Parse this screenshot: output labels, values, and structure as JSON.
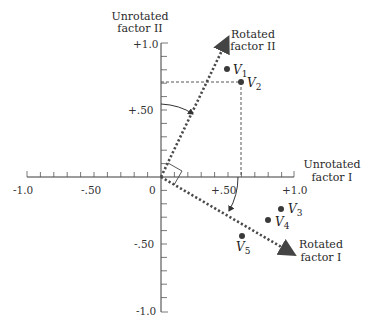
{
  "axes": {
    "unrotated_factor_2_label": [
      "Unrotated",
      "factor II"
    ],
    "unrotated_factor_1_label": [
      "Unrotated",
      "factor I"
    ],
    "rotated_factor_2_label": [
      "Rotated",
      "factor II"
    ],
    "rotated_factor_1_label": [
      "Rotated",
      "factor I"
    ],
    "x_ticks": [
      "-1.0",
      "-.50",
      "0",
      "+.50",
      "+1.0"
    ],
    "y_ticks": [
      "+1.0",
      "+.50",
      "-.50",
      "-1.0"
    ]
  },
  "variables": [
    {
      "name": "V",
      "sub": "1"
    },
    {
      "name": "V",
      "sub": "2"
    },
    {
      "name": "V",
      "sub": "3"
    },
    {
      "name": "V",
      "sub": "4"
    },
    {
      "name": "V",
      "sub": "5"
    }
  ],
  "colors": {
    "axis": "#3a3a3a",
    "rotated_axis": "#4a4a4a",
    "point": "#3a3a3a"
  }
}
